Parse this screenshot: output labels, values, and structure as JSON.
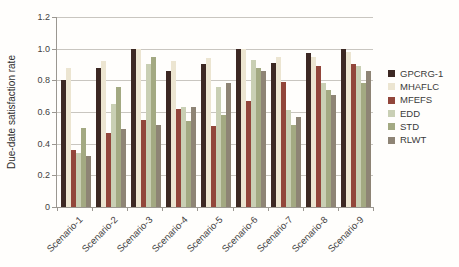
{
  "chart_data": {
    "type": "bar",
    "title": "",
    "xlabel": "",
    "ylabel": "Due-date satisfaction rate",
    "ylim": [
      0,
      1.2
    ],
    "ytick_step": 0.2,
    "yticks": [
      "0",
      "0.2",
      "0.4",
      "0.6",
      "0.8",
      "1.0",
      "1.2"
    ],
    "grid": true,
    "legend_position": "right",
    "categories": [
      "Scenario-1",
      "Scenario-2",
      "Scenario-3",
      "Scenario-4",
      "Scenario-5",
      "Scenario-6",
      "Scenario-7",
      "Scenario-8",
      "Scenario-9"
    ],
    "series": [
      {
        "name": "GPCRG-1",
        "color": "#3c2823",
        "values": [
          0.8,
          0.88,
          1.0,
          0.86,
          0.9,
          1.0,
          0.91,
          0.97,
          1.0
        ]
      },
      {
        "name": "MHAFLC",
        "color": "#ece5d1",
        "values": [
          0.88,
          0.92,
          1.0,
          0.92,
          0.94,
          1.0,
          0.95,
          0.95,
          0.98
        ]
      },
      {
        "name": "MFEFS",
        "color": "#92463b",
        "values": [
          0.36,
          0.47,
          0.55,
          0.62,
          0.51,
          0.67,
          0.79,
          0.89,
          0.9
        ]
      },
      {
        "name": "EDD",
        "color": "#c9cfb4",
        "values": [
          0.34,
          0.65,
          0.9,
          0.63,
          0.76,
          0.93,
          0.61,
          0.78,
          0.89
        ]
      },
      {
        "name": "STD",
        "color": "#a3a982",
        "values": [
          0.5,
          0.76,
          0.95,
          0.54,
          0.58,
          0.88,
          0.52,
          0.74,
          0.78
        ]
      },
      {
        "name": "RLWT",
        "color": "#8e8475",
        "values": [
          0.32,
          0.49,
          0.52,
          0.63,
          0.78,
          0.86,
          0.57,
          0.71,
          0.86
        ]
      }
    ],
    "colors": {
      "gridline": "#c9c6c0",
      "axis": "#9b9791",
      "text": "#3f3f3f"
    }
  }
}
